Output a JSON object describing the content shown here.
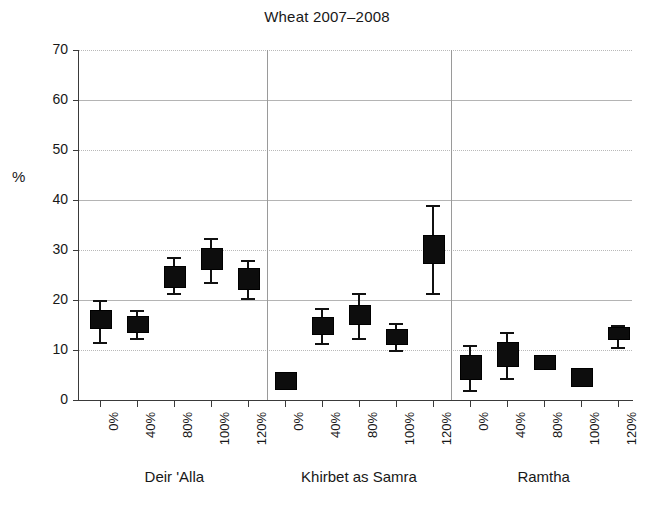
{
  "chart_data": {
    "type": "box",
    "title": "Wheat 2007–2008",
    "xlabel": "",
    "ylabel": "%",
    "ylim": [
      0,
      70
    ],
    "yticks": [
      0,
      10,
      20,
      30,
      40,
      50,
      60,
      70
    ],
    "grid": "horizontal dotted/solid gridlines at every 10%",
    "legend": "none",
    "group_separators": true,
    "categories": [
      "0%",
      "40%",
      "80%",
      "100%",
      "120%"
    ],
    "groups": [
      {
        "name": "Deir 'Alla",
        "boxes": [
          {
            "category": "0%",
            "whisker_low": 11.6,
            "q1": 14.6,
            "median": 15.5,
            "q3": 18.0,
            "whisker_high": 20.0
          },
          {
            "category": "40%",
            "whisker_low": 12.4,
            "q1": 13.8,
            "median": 15.0,
            "q3": 16.8,
            "whisker_high": 18.0
          },
          {
            "category": "80%",
            "whisker_low": 21.4,
            "q1": 22.8,
            "median": 24.8,
            "q3": 26.8,
            "whisker_high": 28.6
          },
          {
            "category": "100%",
            "whisker_low": 23.6,
            "q1": 26.4,
            "median": 28.2,
            "q3": 30.4,
            "whisker_high": 32.4
          },
          {
            "category": "120%",
            "whisker_low": 20.4,
            "q1": 22.4,
            "median": 24.2,
            "q3": 26.4,
            "whisker_high": 28.0
          }
        ]
      },
      {
        "name": "Khirbet as Samra",
        "boxes": [
          {
            "category": "0%",
            "whisker_low": 2.4,
            "q1": 2.4,
            "median": 3.4,
            "q3": 5.6,
            "whisker_high": 5.6
          },
          {
            "category": "40%",
            "whisker_low": 11.4,
            "q1": 13.4,
            "median": 14.8,
            "q3": 16.6,
            "whisker_high": 18.4
          },
          {
            "category": "80%",
            "whisker_low": 12.4,
            "q1": 15.4,
            "median": 17.0,
            "q3": 19.0,
            "whisker_high": 21.4
          },
          {
            "category": "100%",
            "whisker_low": 10.0,
            "q1": 11.4,
            "median": 12.6,
            "q3": 14.2,
            "whisker_high": 15.4
          },
          {
            "category": "120%",
            "whisker_low": 21.4,
            "q1": 27.6,
            "median": 30.2,
            "q3": 33.0,
            "whisker_high": 39.0
          }
        ]
      },
      {
        "name": "Ramtha",
        "boxes": [
          {
            "category": "0%",
            "whisker_low": 2.0,
            "q1": 4.4,
            "median": 6.2,
            "q3": 9.0,
            "whisker_high": 11.0
          },
          {
            "category": "40%",
            "whisker_low": 4.4,
            "q1": 7.0,
            "median": 9.4,
            "q3": 11.6,
            "whisker_high": 13.6
          },
          {
            "category": "80%",
            "whisker_low": 6.2,
            "q1": 6.4,
            "median": 7.4,
            "q3": 9.0,
            "whisker_high": 9.0
          },
          {
            "category": "100%",
            "whisker_low": 3.0,
            "q1": 3.0,
            "median": 4.4,
            "q3": 6.4,
            "whisker_high": 6.4
          },
          {
            "category": "120%",
            "whisker_low": 10.6,
            "q1": 12.4,
            "median": 13.4,
            "q3": 14.6,
            "whisker_high": 15.0
          }
        ]
      }
    ]
  },
  "axis": {
    "y_tick_labels": [
      "70",
      "60",
      "50",
      "40",
      "30",
      "20",
      "10",
      "0"
    ],
    "y_axis_title": "%",
    "x_tick_labels": [
      "0%",
      "40%",
      "80%",
      "100%",
      "120%",
      "0%",
      "40%",
      "80%",
      "100%",
      "120%",
      "0%",
      "40%",
      "80%",
      "100%",
      "120%"
    ],
    "group_labels": [
      "Deir 'Alla",
      "Khirbet as Samra",
      "Ramtha"
    ]
  },
  "header": {
    "title": "Wheat 2007–2008"
  },
  "style": {
    "box_fill": "#0d0d0d",
    "gridline_color": "#b9b9b9",
    "axis_color": "#3a3a3a",
    "text_color": "#181818"
  }
}
